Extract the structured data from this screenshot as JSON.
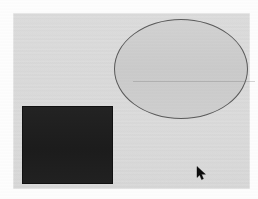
{
  "screen": {
    "width": 258,
    "height": 199,
    "kind": "drawing-canvas",
    "page_background_color": "#fdfdfd"
  },
  "canvas": {
    "name": "drawing-surface",
    "background_color": "#dcdcdc",
    "bounds": {
      "x": 13,
      "y": 13,
      "width": 237,
      "height": 176
    }
  },
  "shapes": [
    {
      "id": "rectangle-1",
      "type": "rectangle",
      "fill_color": "#1f1f1f",
      "stroke_color": "#111111",
      "bounds": {
        "x": 22,
        "y": 106,
        "width": 91,
        "height": 78
      }
    },
    {
      "id": "ellipse-1",
      "type": "ellipse",
      "fill_color": "#cfcfcf",
      "stroke_color": "#5a5a5a",
      "bounds": {
        "x": 114,
        "y": 19,
        "width": 134,
        "height": 100
      }
    }
  ],
  "cursor": {
    "name": "mouse-pointer",
    "shape": "arrow-pointer-icon",
    "color": "#000000",
    "position": {
      "x": 198,
      "y": 170
    }
  }
}
